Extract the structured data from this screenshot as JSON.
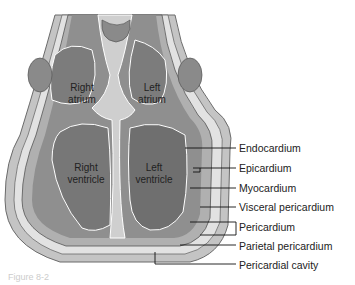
{
  "diagram": {
    "chambers": [
      {
        "id": "right-atrium",
        "line1": "Right",
        "line2": "atrium"
      },
      {
        "id": "left-atrium",
        "line1": "Left",
        "line2": "atrium"
      },
      {
        "id": "right-ventricle",
        "line1": "Right",
        "line2": "ventricle"
      },
      {
        "id": "left-ventricle",
        "line1": "Left",
        "line2": "ventricle"
      }
    ],
    "labels": [
      "Endocardium",
      "Epicardium",
      "Myocardium",
      "Visceral pericardium",
      "Pericardium",
      "Parietal pericardium",
      "Pericardial cavity"
    ],
    "caption": "Figure 8-2",
    "colors": {
      "outer": "#b9b9b9",
      "muscle": "#8c8c8c",
      "chamber": "#7a7a7a",
      "light": "#cfcfcf",
      "outline": "#ffffff"
    }
  }
}
